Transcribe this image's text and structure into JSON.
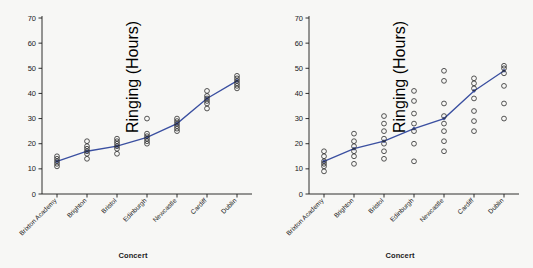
{
  "chart_data": [
    {
      "type": "scatter",
      "panel": "left",
      "title": "",
      "xlabel": "Concert",
      "ylabel": "Ringing (Hours)",
      "categories": [
        "Brixton Academy",
        "Brighton",
        "Bristol",
        "Edinburgh",
        "Newcastle",
        "Cardiff",
        "Dublin"
      ],
      "ylim": [
        0,
        70
      ],
      "yticks": [
        0,
        10,
        20,
        30,
        40,
        50,
        60,
        70
      ],
      "grid": false,
      "legend": "none",
      "series": [
        {
          "name": "Mean trend line",
          "type": "line",
          "color": "#3a4fa0",
          "values": [
            13,
            17,
            19,
            22.5,
            28,
            38,
            45
          ]
        },
        {
          "name": "Observations",
          "type": "points",
          "color": "#2b2b2b",
          "points": [
            {
              "x": "Brixton Academy",
              "y": [
                11,
                12,
                13,
                14,
                15
              ]
            },
            {
              "x": "Brighton",
              "y": [
                14,
                16,
                17,
                18,
                19,
                21
              ]
            },
            {
              "x": "Bristol",
              "y": [
                16,
                18,
                19,
                20,
                21,
                22
              ]
            },
            {
              "x": "Edinburgh",
              "y": [
                20,
                21,
                22,
                23,
                24,
                30
              ]
            },
            {
              "x": "Newcastle",
              "y": [
                25,
                26,
                27,
                28,
                29,
                30
              ]
            },
            {
              "x": "Cardiff",
              "y": [
                34,
                36,
                37,
                38,
                39,
                41
              ]
            },
            {
              "x": "Dublin",
              "y": [
                42,
                43,
                44,
                45,
                46,
                47
              ]
            }
          ]
        }
      ]
    },
    {
      "type": "scatter",
      "panel": "right",
      "title": "",
      "xlabel": "Concert",
      "ylabel": "Ringing (Hours)",
      "categories": [
        "Brixton Academy",
        "Brighton",
        "Bristol",
        "Edinburgh",
        "Newcastle",
        "Cardiff",
        "Dublin"
      ],
      "ylim": [
        0,
        70
      ],
      "yticks": [
        0,
        10,
        20,
        30,
        40,
        50,
        60,
        70
      ],
      "grid": false,
      "legend": "none",
      "series": [
        {
          "name": "Mean trend line",
          "type": "line",
          "color": "#3a4fa0",
          "values": [
            13,
            18,
            21,
            26,
            30,
            41,
            49
          ]
        },
        {
          "name": "Observations",
          "type": "points",
          "color": "#2b2b2b",
          "points": [
            {
              "x": "Brixton Academy",
              "y": [
                9,
                11,
                12,
                13,
                15,
                17
              ]
            },
            {
              "x": "Brighton",
              "y": [
                12,
                15,
                17,
                19,
                21,
                24
              ]
            },
            {
              "x": "Bristol",
              "y": [
                14,
                17,
                20,
                22,
                25,
                28,
                31
              ]
            },
            {
              "x": "Edinburgh",
              "y": [
                13,
                20,
                25,
                28,
                32,
                37,
                41
              ]
            },
            {
              "x": "Newcastle",
              "y": [
                17,
                21,
                25,
                28,
                31,
                36,
                45,
                49
              ]
            },
            {
              "x": "Cardiff",
              "y": [
                25,
                29,
                33,
                38,
                42,
                44,
                46
              ]
            },
            {
              "x": "Dublin",
              "y": [
                30,
                36,
                43,
                48,
                50,
                51
              ]
            }
          ]
        }
      ]
    }
  ],
  "panels": {
    "left": {
      "xlabel": "Concert",
      "ylabel": "Ringing (Hours)",
      "yticks": [
        "0",
        "10",
        "20",
        "30",
        "40",
        "50",
        "60",
        "70"
      ],
      "xticks": [
        "Brixton Academy",
        "Brighton",
        "Bristol",
        "Edinburgh",
        "Newcastle",
        "Cardiff",
        "Dublin"
      ]
    },
    "right": {
      "xlabel": "Concert",
      "ylabel": "Ringing (Hours)",
      "yticks": [
        "0",
        "10",
        "20",
        "30",
        "40",
        "50",
        "60",
        "70"
      ],
      "xticks": [
        "Brixton Academy",
        "Brighton",
        "Bristol",
        "Edinburgh",
        "Newcastle",
        "Cardiff",
        "Dublin"
      ]
    }
  },
  "colors": {
    "line": "#3a4fa0",
    "point": "#2b2b2b",
    "axis": "#1a1a1a",
    "background": "#f7f7f5"
  }
}
